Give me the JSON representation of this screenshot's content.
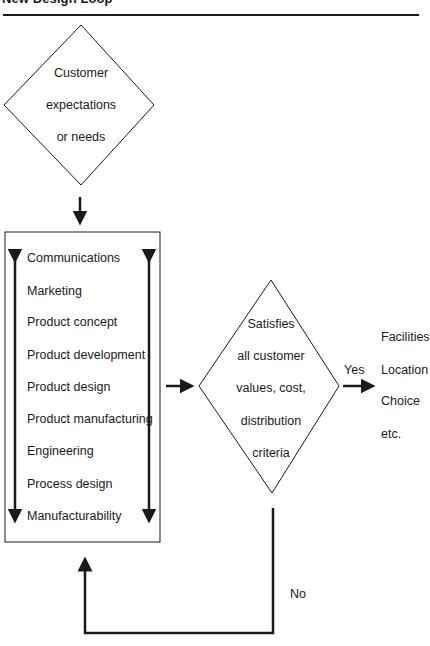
{
  "title": "New Design Loop",
  "start_node": {
    "shape": "diamond",
    "lines": [
      "Customer",
      "expectations",
      "or needs"
    ]
  },
  "process_box": {
    "shape": "rectangle",
    "items": [
      "Communications",
      "Marketing",
      "Product concept",
      "Product development",
      "Product design",
      "Product manufacturing",
      "Engineering",
      "Process design",
      "Manufacturability"
    ],
    "side_arrows": "bidirectional"
  },
  "decision_node": {
    "shape": "diamond",
    "lines": [
      "Satisfies",
      "all customer",
      "values, cost,",
      "distribution",
      "criteria"
    ]
  },
  "yes_branch": {
    "label": "Yes",
    "outcome_lines": [
      "Facilities",
      "Location",
      "Choice",
      "etc."
    ]
  },
  "no_branch": {
    "label": "No"
  },
  "colors": {
    "stroke": "#1a1a1a",
    "background": "#ffffff"
  }
}
